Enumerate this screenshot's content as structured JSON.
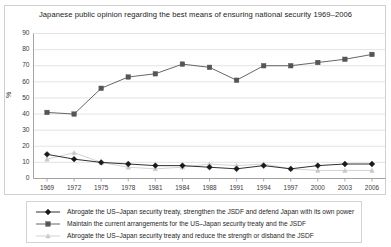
{
  "chart_data": {
    "type": "line",
    "title": "Japanese public opinion regarding the best means of ensuring national security 1969–2006",
    "xlabel": "",
    "ylabel": "%",
    "ylim": [
      0,
      90
    ],
    "yticks": [
      0,
      10,
      20,
      30,
      40,
      50,
      60,
      70,
      80,
      90
    ],
    "grid": true,
    "legend_position": "bottom",
    "categories": [
      "1969",
      "1972",
      "1975",
      "1978",
      "1981",
      "1984",
      "1988",
      "1991",
      "1994",
      "1997",
      "2000",
      "2003",
      "2006"
    ],
    "series": [
      {
        "name": "Abrogate the US–Japan security treaty, strengthen the JSDF and defend Japan with its own power",
        "color": "#1a1a1a",
        "marker": "diamond",
        "values": [
          15,
          12,
          10,
          9,
          8,
          8,
          7,
          6,
          8,
          6,
          8,
          9,
          9
        ]
      },
      {
        "name": "Maintain the current arrangements for the US–Japan security treaty and the JSDF",
        "color": "#555555",
        "marker": "square",
        "values": [
          41,
          40,
          56,
          63,
          65,
          71,
          69,
          61,
          70,
          70,
          72,
          74,
          77
        ]
      },
      {
        "name": "Abrogate the US–Japan security treaty and reduce the strength or disband the JSDF",
        "color": "#c8c8c8",
        "marker": "triangle",
        "values": [
          12,
          16,
          10,
          7,
          6,
          7,
          9,
          8,
          9,
          6,
          5,
          5,
          5
        ]
      }
    ]
  },
  "axis": {
    "y_label": "%",
    "y_ticks": [
      "90",
      "80",
      "70",
      "60",
      "50",
      "40",
      "30",
      "20",
      "10",
      "0"
    ],
    "x_ticks": [
      "1969",
      "1972",
      "1975",
      "1978",
      "1981",
      "1984",
      "1988",
      "1991",
      "1994",
      "1997",
      "2000",
      "2003",
      "2006"
    ]
  },
  "legend": {
    "entries": [
      {
        "label": "Abrogate the US–Japan security treaty, strengthen the JSDF and defend Japan with its own power"
      },
      {
        "label": "Maintain the current arrangements for the US–Japan security treaty and the JSDF"
      },
      {
        "label": "Abrogate the US–Japan security treaty and reduce the strength or disband the JSDF"
      }
    ]
  }
}
